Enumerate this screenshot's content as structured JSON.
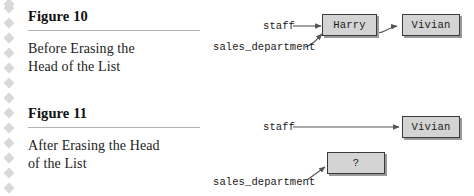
{
  "page": {
    "background_color": "#ffffff",
    "rail_diamond_color": "#d9d9d9",
    "rule_color": "#b4b4b4",
    "box_fill_color": "#d4d4d4",
    "box_border_color": "#3a3a3a",
    "box_shadow_color": "#9a9a9a",
    "arrow_color": "#555555",
    "text_color": "#1a1a1a"
  },
  "figures": [
    {
      "id": "figure-10",
      "heading": "Figure 10",
      "caption_line_1": "Before Erasing the",
      "caption_line_2": "Head of the List",
      "diagram": {
        "variables": [
          {
            "name": "staff",
            "label": "staff",
            "points_to": "Harry"
          },
          {
            "name": "sales_department",
            "label": "sales_department",
            "points_to": "Harry"
          }
        ],
        "nodes": [
          {
            "name": "node-harry",
            "label": "Harry"
          },
          {
            "name": "node-vivian",
            "label": "Vivian"
          }
        ],
        "links": [
          {
            "from": "Harry",
            "to": "Vivian"
          }
        ]
      }
    },
    {
      "id": "figure-11",
      "heading": "Figure 11",
      "caption_line_1": "After Erasing the Head",
      "caption_line_2": "of the List",
      "diagram": {
        "variables": [
          {
            "name": "staff",
            "label": "staff",
            "points_to": "Vivian"
          },
          {
            "name": "sales_department",
            "label": "sales_department",
            "points_to": "?"
          }
        ],
        "nodes": [
          {
            "name": "node-vivian",
            "label": "Vivian"
          },
          {
            "name": "node-unknown",
            "label": "?"
          }
        ],
        "links": []
      }
    }
  ]
}
